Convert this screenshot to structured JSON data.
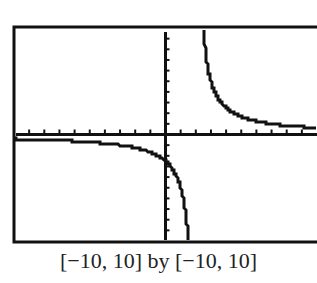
{
  "chart_data": {
    "type": "line",
    "title": "",
    "caption": "[−10, 10] by [−10, 10]",
    "xlim": [
      -10,
      10
    ],
    "ylim": [
      -10,
      10
    ],
    "x_tick_step": 1,
    "y_tick_step": 1,
    "grid": false,
    "series": [
      {
        "name": "f(x)",
        "description": "Rational function with vertical asymptote near x = 2 and horizontal asymptote y = 0",
        "asymptote_x": 2,
        "asymptote_y": 0,
        "points": [
          [
            -10,
            -0.42
          ],
          [
            -8,
            -0.5
          ],
          [
            -6,
            -0.63
          ],
          [
            -4,
            -0.83
          ],
          [
            -2,
            -1.25
          ],
          [
            -1,
            -1.67
          ],
          [
            0,
            -2.5
          ],
          [
            0.5,
            -3.33
          ],
          [
            1,
            -5
          ],
          [
            1.5,
            -10
          ],
          [
            2.5,
            10
          ],
          [
            3,
            5
          ],
          [
            4,
            2.5
          ],
          [
            5,
            1.67
          ],
          [
            6,
            1.25
          ],
          [
            7,
            1.0
          ],
          [
            8,
            0.83
          ],
          [
            10,
            0.63
          ]
        ]
      }
    ],
    "colors": {
      "curve": "#111111",
      "frame": "#111111"
    }
  }
}
